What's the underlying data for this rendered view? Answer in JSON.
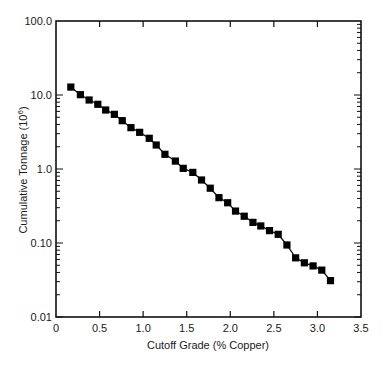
{
  "chart_data": {
    "type": "line",
    "title": "",
    "xlabel": "Cutoff Grade (% Copper)",
    "ylabel": "Cumulative Tonnage (10",
    "ylabel_superscript": "6",
    "ylabel_close": ")",
    "xlim": [
      0,
      3.5
    ],
    "ylim": [
      0.01,
      100.0
    ],
    "yscale": "log",
    "grid": false,
    "legend": null,
    "marker": "square",
    "line_color": "#111111",
    "marker_color": "#000000",
    "x_ticks": [
      {
        "value": 0,
        "label": "0"
      },
      {
        "value": 0.5,
        "label": "0.5"
      },
      {
        "value": 1.0,
        "label": "1.0"
      },
      {
        "value": 1.5,
        "label": "1.5"
      },
      {
        "value": 2.0,
        "label": "2.0"
      },
      {
        "value": 2.5,
        "label": "2.5"
      },
      {
        "value": 3.0,
        "label": "3.0"
      },
      {
        "value": 3.5,
        "label": "3.5"
      }
    ],
    "y_ticks": [
      {
        "value": 100.0,
        "label": "100.0"
      },
      {
        "value": 10.0,
        "label": "10.0"
      },
      {
        "value": 1.0,
        "label": "1.0"
      },
      {
        "value": 0.1,
        "label": "0.10"
      },
      {
        "value": 0.01,
        "label": "0.01"
      }
    ],
    "series": [
      {
        "name": "Cumulative Tonnage",
        "x": [
          0.17,
          0.28,
          0.38,
          0.48,
          0.57,
          0.67,
          0.76,
          0.86,
          0.96,
          1.07,
          1.15,
          1.25,
          1.37,
          1.46,
          1.57,
          1.67,
          1.77,
          1.87,
          1.97,
          2.06,
          2.16,
          2.26,
          2.35,
          2.45,
          2.55,
          2.65,
          2.75,
          2.85,
          2.95,
          3.05,
          3.15
        ],
        "values": [
          12.8,
          10.1,
          8.56,
          7.49,
          6.27,
          5.48,
          4.5,
          3.62,
          3.13,
          2.6,
          2.11,
          1.58,
          1.28,
          1.02,
          0.9,
          0.71,
          0.55,
          0.41,
          0.35,
          0.27,
          0.23,
          0.19,
          0.17,
          0.147,
          0.131,
          0.094,
          0.063,
          0.054,
          0.049,
          0.043,
          0.031
        ]
      }
    ]
  }
}
